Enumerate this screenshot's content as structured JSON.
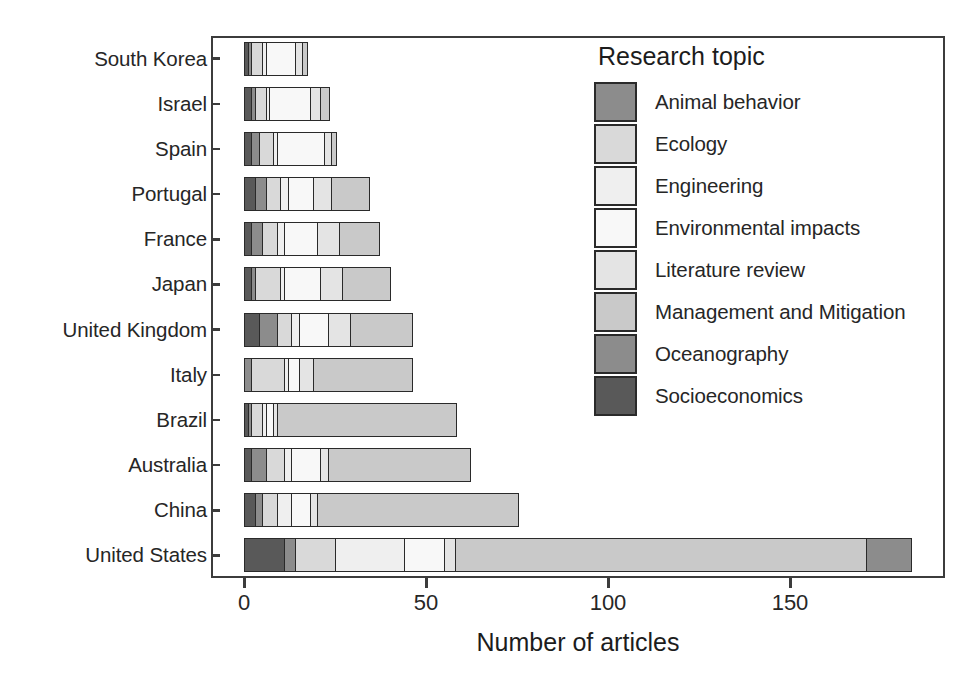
{
  "chart_data": {
    "type": "bar",
    "subtype": "horizontal-stacked",
    "title": "",
    "xlabel": "Number of articles",
    "ylabel": "",
    "xlim": [
      0,
      176
    ],
    "xticks": [
      0,
      50,
      100,
      150
    ],
    "grid": false,
    "legend_title": "Research topic",
    "legend_position": "inside-top-right",
    "categories": [
      "South Korea",
      "Israel",
      "Spain",
      "Portugal",
      "France",
      "Japan",
      "United Kingdom",
      "Italy",
      "Brazil",
      "Australia",
      "China",
      "United States"
    ],
    "series": [
      {
        "name": "Animal behavior",
        "color": "#8c8c8c",
        "values": [
          0,
          0,
          0,
          0,
          0,
          0,
          0,
          0,
          0,
          0,
          0,
          0
        ]
      },
      {
        "name": "Ecology",
        "color": "#d9d9d9",
        "values": [
          3,
          3,
          4,
          4,
          4,
          7,
          4,
          9,
          3,
          5,
          4,
          7
        ]
      },
      {
        "name": "Engineering",
        "color": "#efefef",
        "values": [
          1,
          1,
          1,
          2,
          2,
          1,
          2,
          1,
          1,
          2,
          4,
          11
        ]
      },
      {
        "name": "Environmental impacts",
        "color": "#f7f7f7",
        "values": [
          8,
          11,
          13,
          7,
          9,
          10,
          8,
          3,
          2,
          8,
          5,
          19
        ]
      },
      {
        "name": "Literature review",
        "color": "#e6e6e6",
        "values": [
          2,
          3,
          2,
          5,
          6,
          6,
          6,
          4,
          1,
          2,
          2,
          11
        ]
      },
      {
        "name": "Management and Mitigation",
        "color": "#c9c9c9",
        "values": [
          1,
          2,
          1,
          10,
          11,
          13,
          17,
          27,
          49,
          39,
          55,
          115
        ]
      },
      {
        "name": "Oceanography",
        "color": "#8c8c8c",
        "values": [
          1,
          1,
          2,
          3,
          3,
          1,
          5,
          2,
          1,
          4,
          2,
          12
        ]
      },
      {
        "name": "Socioeconomics",
        "color": "#595959",
        "values": [
          1,
          2,
          2,
          3,
          2,
          2,
          4,
          0,
          1,
          2,
          3,
          8
        ]
      }
    ],
    "totals": [
      17,
      23,
      25,
      34,
      37,
      40,
      46,
      46,
      58,
      62,
      75,
      183
    ],
    "stack_order": [
      "Socioeconomics",
      "Oceanography",
      "Ecology",
      "Engineering",
      "Environmental impacts",
      "Literature review",
      "Management and Mitigation",
      "Animal behavior"
    ],
    "bars": [
      {
        "category": "South Korea",
        "total": 17,
        "segments": [
          {
            "topic": "Socioeconomics",
            "value": 1
          },
          {
            "topic": "Oceanography",
            "value": 1
          },
          {
            "topic": "Ecology",
            "value": 3
          },
          {
            "topic": "Engineering",
            "value": 1
          },
          {
            "topic": "Environmental impacts",
            "value": 8
          },
          {
            "topic": "Literature review",
            "value": 2
          },
          {
            "topic": "Management and Mitigation",
            "value": 1
          }
        ]
      },
      {
        "category": "Israel",
        "total": 23,
        "segments": [
          {
            "topic": "Socioeconomics",
            "value": 2
          },
          {
            "topic": "Oceanography",
            "value": 1
          },
          {
            "topic": "Ecology",
            "value": 3
          },
          {
            "topic": "Engineering",
            "value": 1
          },
          {
            "topic": "Environmental impacts",
            "value": 11
          },
          {
            "topic": "Literature review",
            "value": 3
          },
          {
            "topic": "Management and Mitigation",
            "value": 2
          }
        ]
      },
      {
        "category": "Spain",
        "total": 25,
        "segments": [
          {
            "topic": "Socioeconomics",
            "value": 2
          },
          {
            "topic": "Oceanography",
            "value": 2
          },
          {
            "topic": "Ecology",
            "value": 4
          },
          {
            "topic": "Engineering",
            "value": 1
          },
          {
            "topic": "Environmental impacts",
            "value": 13
          },
          {
            "topic": "Literature review",
            "value": 2
          },
          {
            "topic": "Management and Mitigation",
            "value": 1
          }
        ]
      },
      {
        "category": "Portugal",
        "total": 34,
        "segments": [
          {
            "topic": "Socioeconomics",
            "value": 3
          },
          {
            "topic": "Oceanography",
            "value": 3
          },
          {
            "topic": "Ecology",
            "value": 4
          },
          {
            "topic": "Engineering",
            "value": 2
          },
          {
            "topic": "Environmental impacts",
            "value": 7
          },
          {
            "topic": "Literature review",
            "value": 5
          },
          {
            "topic": "Management and Mitigation",
            "value": 10
          }
        ]
      },
      {
        "category": "France",
        "total": 37,
        "segments": [
          {
            "topic": "Socioeconomics",
            "value": 2
          },
          {
            "topic": "Oceanography",
            "value": 3
          },
          {
            "topic": "Ecology",
            "value": 4
          },
          {
            "topic": "Engineering",
            "value": 2
          },
          {
            "topic": "Environmental impacts",
            "value": 9
          },
          {
            "topic": "Literature review",
            "value": 6
          },
          {
            "topic": "Management and Mitigation",
            "value": 11
          }
        ]
      },
      {
        "category": "Japan",
        "total": 40,
        "segments": [
          {
            "topic": "Socioeconomics",
            "value": 2
          },
          {
            "topic": "Oceanography",
            "value": 1
          },
          {
            "topic": "Ecology",
            "value": 7
          },
          {
            "topic": "Engineering",
            "value": 1
          },
          {
            "topic": "Environmental impacts",
            "value": 10
          },
          {
            "topic": "Literature review",
            "value": 6
          },
          {
            "topic": "Management and Mitigation",
            "value": 13
          }
        ]
      },
      {
        "category": "United Kingdom",
        "total": 46,
        "segments": [
          {
            "topic": "Socioeconomics",
            "value": 4
          },
          {
            "topic": "Oceanography",
            "value": 5
          },
          {
            "topic": "Ecology",
            "value": 4
          },
          {
            "topic": "Engineering",
            "value": 2
          },
          {
            "topic": "Environmental impacts",
            "value": 8
          },
          {
            "topic": "Literature review",
            "value": 6
          },
          {
            "topic": "Management and Mitigation",
            "value": 17
          }
        ]
      },
      {
        "category": "Italy",
        "total": 46,
        "segments": [
          {
            "topic": "Oceanography",
            "value": 2
          },
          {
            "topic": "Ecology",
            "value": 9
          },
          {
            "topic": "Engineering",
            "value": 1
          },
          {
            "topic": "Environmental impacts",
            "value": 3
          },
          {
            "topic": "Literature review",
            "value": 4
          },
          {
            "topic": "Management and Mitigation",
            "value": 27
          }
        ]
      },
      {
        "category": "Brazil",
        "total": 58,
        "segments": [
          {
            "topic": "Socioeconomics",
            "value": 1
          },
          {
            "topic": "Oceanography",
            "value": 1
          },
          {
            "topic": "Ecology",
            "value": 3
          },
          {
            "topic": "Engineering",
            "value": 1
          },
          {
            "topic": "Environmental impacts",
            "value": 2
          },
          {
            "topic": "Literature review",
            "value": 1
          },
          {
            "topic": "Management and Mitigation",
            "value": 49
          }
        ]
      },
      {
        "category": "Australia",
        "total": 62,
        "segments": [
          {
            "topic": "Socioeconomics",
            "value": 2
          },
          {
            "topic": "Oceanography",
            "value": 4
          },
          {
            "topic": "Ecology",
            "value": 5
          },
          {
            "topic": "Engineering",
            "value": 2
          },
          {
            "topic": "Environmental impacts",
            "value": 8
          },
          {
            "topic": "Literature review",
            "value": 2
          },
          {
            "topic": "Management and Mitigation",
            "value": 39
          }
        ]
      },
      {
        "category": "China",
        "total": 75,
        "segments": [
          {
            "topic": "Socioeconomics",
            "value": 3
          },
          {
            "topic": "Oceanography",
            "value": 2
          },
          {
            "topic": "Ecology",
            "value": 4
          },
          {
            "topic": "Engineering",
            "value": 4
          },
          {
            "topic": "Environmental impacts",
            "value": 5
          },
          {
            "topic": "Literature review",
            "value": 2
          },
          {
            "topic": "Management and Mitigation",
            "value": 55
          }
        ]
      },
      {
        "category": "United States",
        "total": 183,
        "segments": [
          {
            "topic": "Socioeconomics",
            "value": 11
          },
          {
            "topic": "Oceanography",
            "value": 3
          },
          {
            "topic": "Ecology",
            "value": 11
          },
          {
            "topic": "Engineering",
            "value": 19
          },
          {
            "topic": "Environmental impacts",
            "value": 11
          },
          {
            "topic": "Literature review",
            "value": 3
          },
          {
            "topic": "Management and Mitigation",
            "value": 113
          },
          {
            "topic": "Animal behavior",
            "value": 12
          }
        ]
      }
    ]
  },
  "legend": {
    "title": "Research topic",
    "items": [
      {
        "label": "Animal behavior",
        "color": "#8c8c8c"
      },
      {
        "label": "Ecology",
        "color": "#d9d9d9"
      },
      {
        "label": "Engineering",
        "color": "#efefef"
      },
      {
        "label": "Environmental impacts",
        "color": "#f8f8f8"
      },
      {
        "label": "Literature review",
        "color": "#e4e4e4"
      },
      {
        "label": "Management and Mitigation",
        "color": "#c9c9c9"
      },
      {
        "label": "Oceanography",
        "color": "#8c8c8c"
      },
      {
        "label": "Socioeconomics",
        "color": "#595959"
      }
    ]
  },
  "axes": {
    "x_title": "Number of articles",
    "x_ticks": [
      "0",
      "50",
      "100",
      "150"
    ],
    "y_ticks": [
      "South Korea",
      "Israel",
      "Spain",
      "Portugal",
      "France",
      "Japan",
      "United Kingdom",
      "Italy",
      "Brazil",
      "Australia",
      "China",
      "United States"
    ]
  },
  "style": {
    "frame_color": "#3c3c3c",
    "segment_border": "#2a2a2a",
    "background": "#ffffff"
  }
}
